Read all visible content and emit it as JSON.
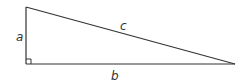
{
  "diagram": {
    "type": "right-triangle",
    "labels": {
      "a": "a",
      "b": "b",
      "c": "c"
    },
    "vertices": {
      "top": [
        26,
        7
      ],
      "right_angle": [
        26,
        64
      ],
      "far": [
        235,
        64
      ]
    },
    "right_angle_marker": true,
    "colors": {
      "stroke": "#333333",
      "label": "#333333",
      "background": "#ffffff"
    }
  }
}
